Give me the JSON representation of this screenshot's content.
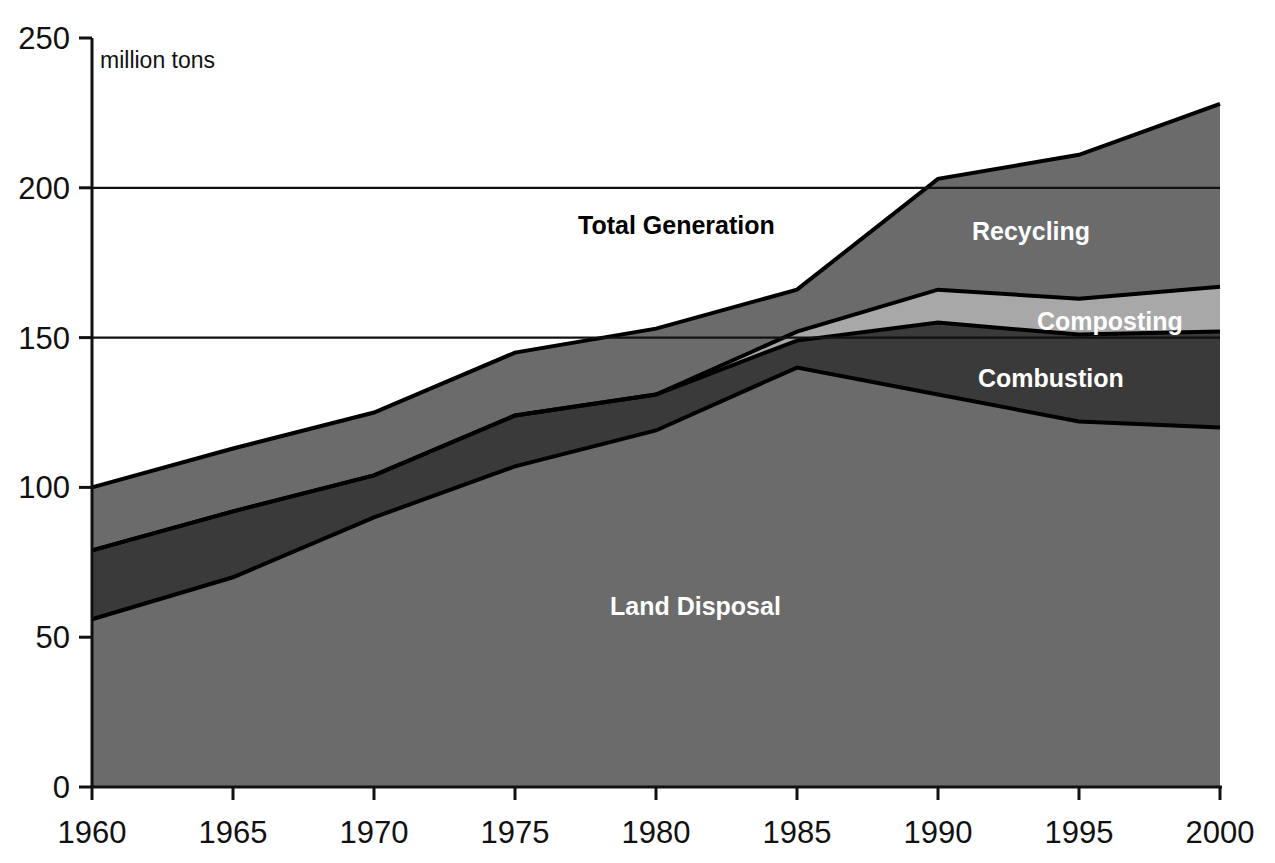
{
  "figure": {
    "units_note": "million tons",
    "background_color": "#ffffff"
  },
  "axes": {
    "y_ticks": [
      "0",
      "50",
      "100",
      "150",
      "200",
      "250"
    ],
    "x_ticks": [
      "1960",
      "1965",
      "1970",
      "1975",
      "1980",
      "1985",
      "1990",
      "1995",
      "2000"
    ],
    "y_min": 0,
    "y_max": 250,
    "x_min": 1960,
    "x_max": 2000
  },
  "labels": {
    "total_generation": "Total Generation",
    "recycling": "Recycling",
    "composting": "Composting",
    "combustion": "Combustion",
    "land_disposal": "Land Disposal"
  },
  "colors": {
    "land_disposal": "#6b6b6b",
    "combustion": "#3a3a3a",
    "composting": "#a8a8a8",
    "recycling": "#6b6b6b",
    "outline": "#000000",
    "axis": "#111111"
  },
  "chart_data": {
    "type": "area",
    "title": "",
    "subtitle": "",
    "xlabel": "",
    "ylabel": "million tons",
    "xlim": [
      1960,
      2000
    ],
    "ylim": [
      0,
      250
    ],
    "grid": "horizontal gridlines at 150 and 200 only",
    "legend": "inline area labels",
    "stacked": true,
    "x": [
      1960,
      1965,
      1970,
      1975,
      1980,
      1985,
      1990,
      1995,
      2000
    ],
    "series": [
      {
        "name": "Land Disposal",
        "cumulative": [
          56,
          70,
          90,
          107,
          119,
          140,
          131,
          122,
          120
        ],
        "values": [
          56,
          70,
          90,
          107,
          119,
          140,
          131,
          122,
          120
        ]
      },
      {
        "name": "Combustion",
        "cumulative": [
          79,
          92,
          104,
          124,
          131,
          149,
          155,
          151,
          152
        ],
        "values": [
          23,
          22,
          14,
          17,
          12,
          9,
          24,
          29,
          32
        ]
      },
      {
        "name": "Composting",
        "cumulative": [
          79,
          92,
          104,
          124,
          131,
          152,
          166,
          163,
          167
        ],
        "values": [
          0,
          0,
          0,
          0,
          0,
          3,
          11,
          12,
          15
        ]
      },
      {
        "name": "Recycling",
        "cumulative": [
          100,
          113,
          125,
          145,
          153,
          166,
          203,
          211,
          228
        ],
        "values": [
          21,
          21,
          21,
          21,
          22,
          14,
          37,
          48,
          61
        ]
      }
    ],
    "total_generation": [
      100,
      113,
      125,
      145,
      153,
      166,
      203,
      211,
      228
    ]
  }
}
